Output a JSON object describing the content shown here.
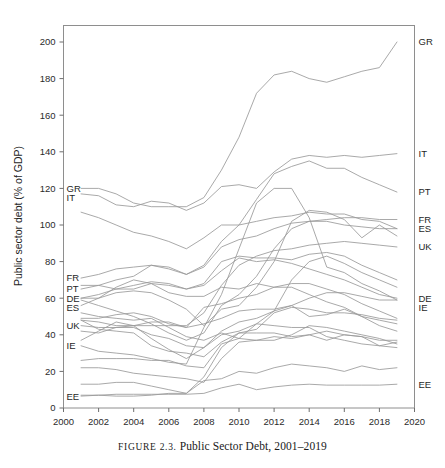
{
  "figure": {
    "caption_prefix": "FIGURE 2.3.",
    "caption_text": "Public Sector Debt, 2001–2019"
  },
  "axes": {
    "y_title": "Public sector debt (% of GDP)",
    "y_ticks": [
      "0",
      "20",
      "40",
      "60",
      "80",
      "100",
      "120",
      "140",
      "160",
      "180",
      "200"
    ],
    "x_ticks": [
      "2000",
      "2002",
      "2004",
      "2006",
      "2008",
      "2010",
      "2012",
      "2014",
      "2016",
      "2018",
      "2020"
    ],
    "x_range": [
      2000,
      2020
    ],
    "y_range": [
      0,
      208
    ]
  },
  "left_labels": [
    "GR",
    "IT",
    "FR",
    "PT",
    "DE",
    "ES",
    "UK",
    "IE",
    "EE"
  ],
  "right_labels": [
    "GR",
    "IT",
    "PT",
    "FR",
    "ES",
    "UK",
    "IE",
    "DE",
    "EE"
  ],
  "colors": {
    "line": "#9a9a9a",
    "border": "#8e8e8e",
    "text": "#1f1f1f",
    "background": "#ffffff"
  },
  "chart_data": {
    "type": "line",
    "title": "Public Sector Debt, 2001–2019",
    "xlabel": "",
    "ylabel": "Public sector debt (% of GDP)",
    "xlim": [
      2000,
      2020
    ],
    "ylim": [
      0,
      208
    ],
    "grid": false,
    "legend": "inline-endpoint-labels",
    "x": [
      2001,
      2002,
      2003,
      2004,
      2005,
      2006,
      2007,
      2008,
      2009,
      2010,
      2011,
      2012,
      2013,
      2014,
      2015,
      2016,
      2017,
      2018,
      2019
    ],
    "series": [
      {
        "name": "GR",
        "label_left": "GR",
        "label_right": "GR",
        "values": [
          120,
          120,
          117,
          112,
          110,
          110,
          110,
          115,
          130,
          148,
          172,
          182,
          184,
          180,
          178,
          181,
          184,
          186,
          200
        ]
      },
      {
        "name": "IT",
        "label_left": "IT",
        "label_right": "IT",
        "values": [
          117,
          116,
          111,
          110,
          113,
          112,
          108,
          112,
          121,
          122,
          120,
          129,
          136,
          138,
          137,
          138,
          137,
          138,
          139
        ]
      },
      {
        "name": "PT",
        "label_left": "PT",
        "label_right": "PT",
        "values": [
          65,
          67,
          70,
          72,
          78,
          77,
          73,
          78,
          91,
          100,
          114,
          128,
          132,
          135,
          131,
          131,
          126,
          122,
          118
        ]
      },
      {
        "name": "FR",
        "label_left": "FR",
        "label_right": "FR",
        "values": [
          71,
          73,
          76,
          77,
          78,
          76,
          73,
          77,
          88,
          92,
          94,
          98,
          101,
          102,
          103,
          104,
          104,
          103,
          103
        ]
      },
      {
        "name": "ES",
        "label_left": "ES",
        "label_right": "ES",
        "values": [
          59,
          56,
          53,
          50,
          46,
          41,
          37,
          41,
          56,
          62,
          72,
          87,
          98,
          102,
          102,
          100,
          99,
          98,
          98
        ]
      },
      {
        "name": "UK",
        "label_left": "UK",
        "label_right": "UK",
        "values": [
          45,
          44,
          44,
          45,
          45,
          45,
          45,
          52,
          67,
          78,
          83,
          86,
          87,
          89,
          90,
          91,
          90,
          89,
          88
        ]
      },
      {
        "name": "DE",
        "label_left": "DE",
        "label_right": "DE",
        "values": [
          60,
          62,
          65,
          67,
          69,
          68,
          65,
          67,
          75,
          82,
          80,
          81,
          79,
          76,
          73,
          70,
          66,
          62,
          60
        ]
      },
      {
        "name": "IE",
        "label_left": "IE",
        "label_right": "IE",
        "values": [
          34,
          31,
          30,
          29,
          27,
          25,
          24,
          44,
          62,
          87,
          112,
          120,
          120,
          104,
          77,
          74,
          68,
          64,
          59
        ]
      },
      {
        "name": "EE",
        "label_left": "EE",
        "label_right": "EE",
        "values": [
          6.5,
          7,
          7.5,
          7.5,
          7.5,
          7.5,
          7.5,
          8,
          11,
          13,
          10,
          11.5,
          12.5,
          13,
          12.5,
          12.5,
          12.5,
          12.5,
          13
        ]
      },
      {
        "name": "BE",
        "label_left": "",
        "label_right": "",
        "values": [
          107,
          104,
          100,
          96,
          94,
          91,
          87,
          93,
          100,
          100,
          102,
          104,
          105,
          107,
          106,
          106,
          103,
          102,
          98
        ]
      },
      {
        "name": "AT",
        "label_left": "",
        "label_right": "",
        "values": [
          67,
          67,
          65,
          65,
          68,
          67,
          65,
          68,
          80,
          83,
          82,
          82,
          81,
          84,
          85,
          83,
          78,
          74,
          70
        ]
      },
      {
        "name": "NL",
        "label_left": "",
        "label_right": "",
        "values": [
          49,
          49,
          51,
          52,
          50,
          46,
          44,
          55,
          57,
          60,
          62,
          66,
          68,
          68,
          65,
          62,
          57,
          53,
          49
        ]
      },
      {
        "name": "FI",
        "label_left": "",
        "label_right": "",
        "values": [
          42,
          41,
          44,
          44,
          40,
          38,
          34,
          33,
          42,
          47,
          49,
          53,
          56,
          60,
          63,
          63,
          61,
          59,
          59
        ]
      },
      {
        "name": "CY",
        "label_left": "",
        "label_right": "",
        "values": [
          56,
          60,
          63,
          64,
          63,
          59,
          54,
          45,
          54,
          56,
          66,
          80,
          102,
          108,
          107,
          103,
          93,
          100,
          94
        ]
      },
      {
        "name": "SI",
        "label_left": "",
        "label_right": "",
        "values": [
          26,
          27,
          27,
          27,
          26,
          26,
          23,
          22,
          35,
          38,
          46,
          53,
          70,
          80,
          83,
          79,
          74,
          70,
          66
        ]
      },
      {
        "name": "MT",
        "label_left": "",
        "label_right": "",
        "values": [
          60,
          60,
          66,
          70,
          68,
          63,
          61,
          61,
          66,
          65,
          68,
          66,
          66,
          62,
          58,
          55,
          50,
          45,
          42
        ]
      },
      {
        "name": "SK",
        "label_left": "",
        "label_right": "",
        "values": [
          48,
          43,
          42,
          41,
          34,
          31,
          30,
          28,
          36,
          41,
          43,
          52,
          55,
          54,
          52,
          52,
          51,
          49,
          48
        ]
      },
      {
        "name": "LV",
        "label_left": "",
        "label_right": "",
        "values": [
          13,
          13,
          14,
          14,
          12,
          10,
          8,
          17,
          33,
          41,
          41,
          41,
          39,
          40,
          37,
          40,
          39,
          37,
          37
        ]
      },
      {
        "name": "LT",
        "label_left": "",
        "label_right": "",
        "values": [
          22,
          22,
          21,
          19,
          18,
          17,
          16,
          14,
          27,
          36,
          37,
          39,
          38,
          40,
          42,
          40,
          39,
          34,
          36
        ]
      },
      {
        "name": "LU",
        "label_left": "",
        "label_right": "",
        "values": [
          7,
          7,
          6.5,
          6.5,
          7,
          8,
          8,
          15,
          16,
          20,
          19,
          22,
          24,
          23,
          22,
          20,
          23,
          21,
          22
        ]
      },
      {
        "name": "DK",
        "label_left": "",
        "label_right": "",
        "values": [
          48,
          47,
          45,
          45,
          38,
          32,
          27,
          33,
          40,
          42,
          46,
          45,
          44,
          44,
          39,
          37,
          35,
          34,
          33
        ]
      },
      {
        "name": "SE",
        "label_left": "",
        "label_right": "",
        "values": [
          52,
          50,
          49,
          48,
          49,
          44,
          39,
          37,
          41,
          38,
          37,
          37,
          40,
          45,
          44,
          42,
          40,
          38,
          35
        ]
      },
      {
        "name": "PL",
        "label_left": "",
        "label_right": "",
        "values": [
          37,
          42,
          47,
          45,
          47,
          47,
          44,
          46,
          49,
          53,
          54,
          54,
          56,
          50,
          51,
          54,
          50,
          48,
          46
        ]
      }
    ]
  }
}
